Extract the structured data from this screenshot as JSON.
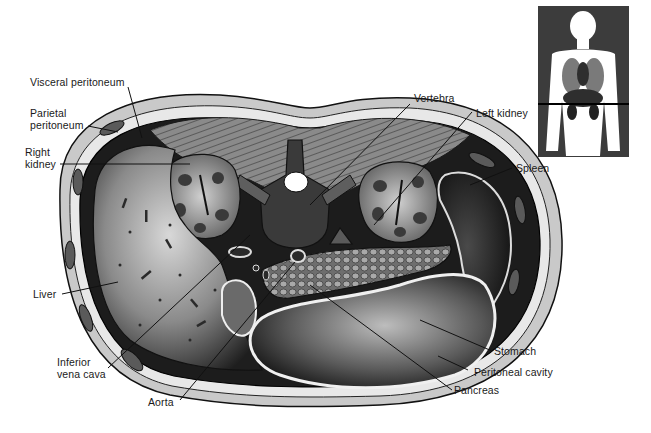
{
  "diagram": {
    "labels": {
      "visceral_peritoneum": "Visceral peritoneum",
      "parietal_peritoneum_1": "Parietal",
      "parietal_peritoneum_2": "peritoneum",
      "right_kidney_1": "Right",
      "right_kidney_2": "kidney",
      "liver": "Liver",
      "inferior_vena_cava_1": "Inferior",
      "inferior_vena_cava_2": "vena cava",
      "aorta": "Aorta",
      "vertebra": "Vertebra",
      "left_kidney": "Left kidney",
      "spleen": "Spleen",
      "stomach": "Stomach",
      "peritoneal_cavity": "Peritoneal cavity",
      "pancreas": "Pancreas"
    },
    "inset": {
      "description": "Body outline showing section plane through kidneys",
      "section_line": "horizontal"
    },
    "colors": {
      "background": "#ffffff",
      "ink": "#1a1a1a",
      "inset_bg": "#3c3c3c"
    }
  }
}
